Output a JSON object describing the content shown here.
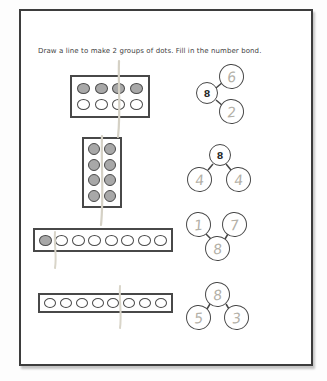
{
  "page": {
    "instruction": "Draw a line to make 2 groups of dots.  Fill in the number bond.",
    "colors": {
      "ink": "#3d3d3d",
      "pencil": "#d3cfc3",
      "pencil_digit": "#b3b0a7",
      "dot_fill": "#a8a8a8",
      "paper": "#ffffff"
    }
  },
  "rows": [
    {
      "dot_box": {
        "shape": "2-rows-by-4-cols",
        "rows": 2,
        "cols": 4,
        "filled": [
          true,
          true,
          true,
          true,
          false,
          false,
          false,
          false
        ],
        "pencil_split": "6 | 2"
      },
      "bond": {
        "layout": "whole-left",
        "whole": {
          "value": "8",
          "handwritten": false
        },
        "part1": {
          "value": "6",
          "handwritten": true
        },
        "part2": {
          "value": "2",
          "handwritten": true
        }
      }
    },
    {
      "dot_box": {
        "shape": "4-rows-by-2-cols",
        "rows": 4,
        "cols": 2,
        "filled": [
          true,
          true,
          true,
          true,
          true,
          true,
          true,
          true
        ],
        "pencil_split": "4 | 4"
      },
      "bond": {
        "layout": "whole-top",
        "whole": {
          "value": "8",
          "handwritten": false
        },
        "part1": {
          "value": "4",
          "handwritten": true
        },
        "part2": {
          "value": "4",
          "handwritten": true
        }
      }
    },
    {
      "dot_box": {
        "shape": "1-row-by-8-cols",
        "rows": 1,
        "cols": 8,
        "filled": [
          true,
          false,
          false,
          false,
          false,
          false,
          false,
          false
        ],
        "pencil_split": "1 | 7"
      },
      "bond": {
        "layout": "whole-bottom",
        "whole": {
          "value": "8",
          "handwritten": true
        },
        "part1": {
          "value": "1",
          "handwritten": true
        },
        "part2": {
          "value": "7",
          "handwritten": true
        }
      }
    },
    {
      "dot_box": {
        "shape": "1-row-by-8-cols",
        "rows": 1,
        "cols": 8,
        "filled": [
          false,
          false,
          false,
          false,
          false,
          false,
          false,
          false
        ],
        "pencil_split": "5 | 3"
      },
      "bond": {
        "layout": "whole-top",
        "whole": {
          "value": "8",
          "handwritten": true
        },
        "part1": {
          "value": "5",
          "handwritten": true
        },
        "part2": {
          "value": "3",
          "handwritten": true
        }
      }
    }
  ]
}
